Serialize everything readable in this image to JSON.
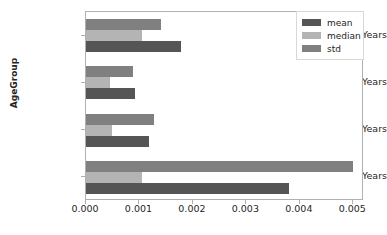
{
  "chart_data": {
    "type": "bar",
    "orientation": "horizontal",
    "title": "",
    "xlabel": "",
    "ylabel": "AgeGroup",
    "categories": [
      "15-19 Years",
      "10-14 Years",
      "05-09 Years",
      "01-04 Years"
    ],
    "series": [
      {
        "name": "mean",
        "color": "#555555",
        "values": [
          0.00178,
          0.00092,
          0.00117,
          0.0038
        ]
      },
      {
        "name": "median",
        "color": "#b4b4b4",
        "values": [
          0.00105,
          0.00044,
          0.00048,
          0.00105
        ]
      },
      {
        "name": "std",
        "color": "#808080",
        "values": [
          0.0014,
          0.00088,
          0.00127,
          0.005
        ]
      }
    ],
    "xlim": [
      0.0,
      0.0052
    ],
    "xticks": [
      0.0,
      0.001,
      0.002,
      0.003,
      0.004,
      0.005
    ],
    "xtick_labels": [
      "0.000",
      "0.001",
      "0.002",
      "0.003",
      "0.004",
      "0.005"
    ],
    "grid": false,
    "legend_position": "upper right",
    "legend_entries": [
      "mean",
      "median",
      "std"
    ],
    "bar_order_top_to_bottom": [
      "std",
      "median",
      "mean"
    ]
  },
  "axes": {
    "frame_color": "#b0b0b0",
    "tick_color": "#b0b0b0",
    "text_color": "#262626"
  }
}
